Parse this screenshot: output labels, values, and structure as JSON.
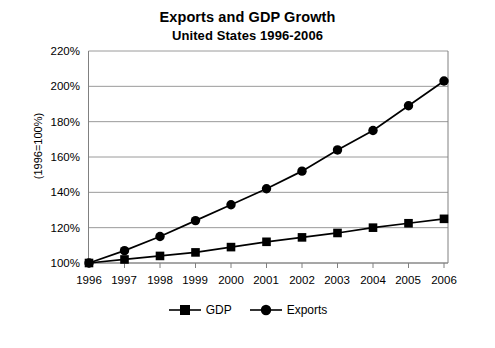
{
  "chart_data": {
    "type": "line",
    "title": "Exports and GDP Growth",
    "subtitle": "United States 1996-2006",
    "xlabel": "",
    "ylabel": "(1996=100%)",
    "categories": [
      "1996",
      "1997",
      "1998",
      "1999",
      "2000",
      "2001",
      "2002",
      "2003",
      "2004",
      "2005",
      "2006"
    ],
    "x": [
      1996,
      1997,
      1998,
      1999,
      2000,
      2001,
      2002,
      2003,
      2004,
      2005,
      2006
    ],
    "series": [
      {
        "name": "GDP",
        "marker": "square",
        "color": "#000000",
        "values": [
          100,
          102,
          104,
          106,
          109,
          112,
          114.5,
          117,
          120,
          122.5,
          125
        ]
      },
      {
        "name": "Exports",
        "marker": "circle",
        "color": "#000000",
        "values": [
          100,
          107,
          115,
          124,
          133,
          142,
          152,
          164,
          175,
          189,
          203
        ]
      }
    ],
    "ylim": [
      100,
      220
    ],
    "ytick_values": [
      100,
      120,
      140,
      160,
      180,
      200,
      220
    ],
    "ytick_labels": [
      "100%",
      "120%",
      "140%",
      "160%",
      "180%",
      "200%",
      "220%"
    ],
    "grid": true,
    "grid_axis": "y",
    "legend_position": "bottom",
    "grid_color": "#9a9a9a",
    "axis_color": "#808080",
    "plot_background": "#ffffff"
  }
}
